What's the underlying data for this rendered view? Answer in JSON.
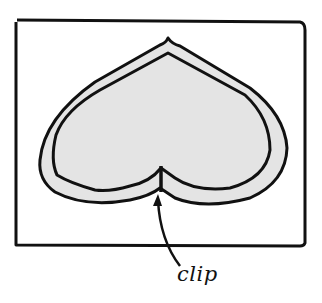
{
  "diagram": {
    "labels": {
      "clip": "clip"
    },
    "colors": {
      "stroke": "#111111",
      "fill": "#e4e4e4",
      "background": "#ffffff"
    },
    "parts": [
      "frame",
      "outer-outline",
      "inner-outline",
      "clip-notch",
      "pointer-arrow"
    ]
  }
}
